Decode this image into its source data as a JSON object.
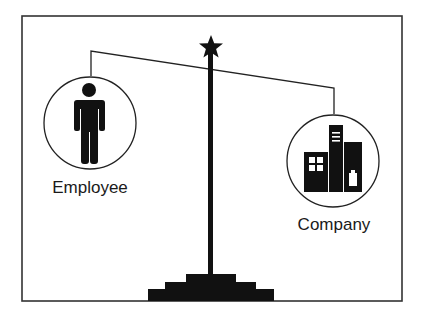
{
  "diagram": {
    "type": "balance-scale",
    "left": {
      "label": "Employee",
      "icon": "person-icon"
    },
    "right": {
      "label": "Company",
      "icon": "buildings-icon"
    },
    "top_icon": "star-icon",
    "tilt": "left side higher, right side lower",
    "colors": {
      "ink": "#111111",
      "frame": "#333333",
      "background": "#ffffff"
    }
  }
}
